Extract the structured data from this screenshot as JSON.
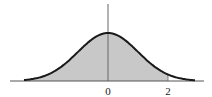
{
  "chart_data": {
    "type": "area",
    "title": "",
    "xlabel": "",
    "ylabel": "",
    "x_ticks": [
      "0",
      "2"
    ],
    "shaded_region": {
      "from": "-inf",
      "to": 2
    },
    "curve": "standard normal pdf",
    "xlim": [
      -2.8,
      2.9
    ],
    "colors": {
      "curve": "#1a1a1a",
      "fill": "#c8c8c8",
      "axis": "#555555"
    }
  },
  "labels": {
    "zero": "0",
    "two": "2"
  }
}
